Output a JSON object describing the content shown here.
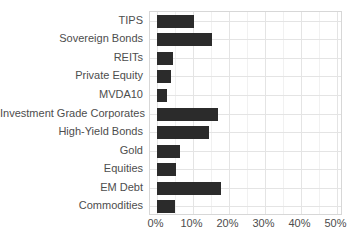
{
  "chart_data": {
    "type": "bar",
    "orientation": "horizontal",
    "title": "",
    "xlabel": "",
    "ylabel": "",
    "unit": "%",
    "categories": [
      "TIPS",
      "Sovereign Bonds",
      "REITs",
      "Private Equity",
      "MVDA10",
      "Investment Grade Corporates",
      "High-Yield Bonds",
      "Gold",
      "Equities",
      "EM Debt",
      "Commodities"
    ],
    "values": [
      10.5,
      15.5,
      4.5,
      4,
      3,
      17,
      14.5,
      6.5,
      5.5,
      18,
      5
    ],
    "xlim": [
      0,
      50
    ],
    "x_ticks": [
      "0%",
      "10%",
      "20%",
      "30%",
      "40%",
      "50%"
    ],
    "x_tick_values": [
      0,
      10,
      20,
      30,
      40,
      50
    ],
    "minor_gridline_values": [
      5,
      15,
      25,
      35,
      45
    ],
    "grid": "on",
    "legend": "none",
    "colors": {
      "bar": "#2b2b2b",
      "grid_major": "#e4e4e4",
      "grid_minor": "#f1f1f1",
      "panel_border": "#d7d7d7",
      "label_text": "#4d4d4d",
      "background": "#ffffff"
    }
  }
}
